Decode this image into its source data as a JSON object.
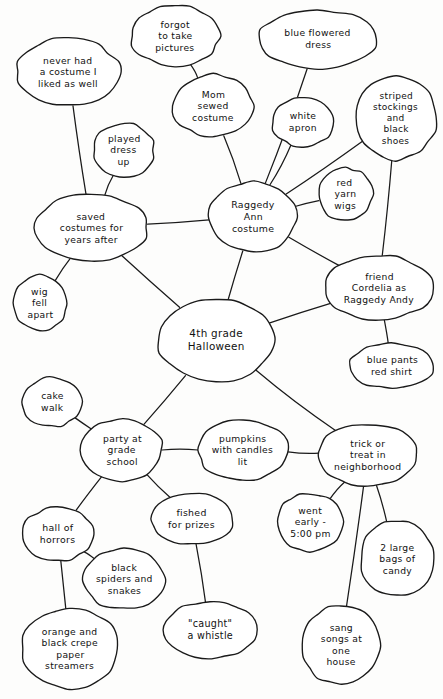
{
  "diagram": {
    "style": "hand-drawn ink on paper",
    "ink_color": "#1a1a1a",
    "paper_color": "#fdfdfc",
    "width": 443,
    "height": 699
  },
  "nodes": [
    {
      "id": "never_had",
      "label": "never had\na costume I\nliked as well",
      "cx": 68,
      "cy": 72,
      "rx": 51,
      "ry": 34,
      "font": 9.2
    },
    {
      "id": "forgot_pictures",
      "label": "forgot\nto take\npictures",
      "cx": 175,
      "cy": 36,
      "rx": 44,
      "ry": 30,
      "font": 9.2
    },
    {
      "id": "blue_dress",
      "label": "blue flowered\ndress",
      "cx": 318,
      "cy": 39,
      "rx": 59,
      "ry": 29,
      "font": 9.2
    },
    {
      "id": "mom_sewed",
      "label": "Mom\nsewed\ncostume",
      "cx": 213,
      "cy": 106,
      "rx": 40,
      "ry": 31,
      "font": 9.2
    },
    {
      "id": "white_apron",
      "label": "white\napron",
      "cx": 303,
      "cy": 122,
      "rx": 30,
      "ry": 25,
      "font": 9.2
    },
    {
      "id": "striped_stockings",
      "label": "striped\nstockings\nand\nblack\nshoes",
      "cx": 396,
      "cy": 118,
      "rx": 40,
      "ry": 41,
      "font": 9.0
    },
    {
      "id": "played_dress_up",
      "label": "played\ndress\nup",
      "cx": 124,
      "cy": 150,
      "rx": 30,
      "ry": 27,
      "font": 9.2
    },
    {
      "id": "red_yarn_wigs",
      "label": "red\nyarn\nwigs",
      "cx": 345,
      "cy": 194,
      "rx": 27,
      "ry": 26,
      "font": 9.2
    },
    {
      "id": "raggedy_ann",
      "label": "Raggedy\nAnn\ncostume",
      "cx": 253,
      "cy": 217,
      "rx": 44,
      "ry": 35,
      "font": 9.4
    },
    {
      "id": "saved_costumes",
      "label": "saved\ncostumes for\nyears after",
      "cx": 91,
      "cy": 228,
      "rx": 57,
      "ry": 33,
      "font": 9.2
    },
    {
      "id": "friend_cordelia",
      "label": "friend\nCordelia as\nRaggedy Andy",
      "cx": 379,
      "cy": 288,
      "rx": 53,
      "ry": 32,
      "font": 9.2
    },
    {
      "id": "wig_fell_apart",
      "label": "wig\nfell\napart",
      "cx": 40,
      "cy": 303,
      "rx": 27,
      "ry": 27,
      "font": 9.2
    },
    {
      "id": "halloween",
      "label": "4th grade\nHalloween",
      "cx": 216,
      "cy": 340,
      "rx": 58,
      "ry": 42,
      "font": 10.4
    },
    {
      "id": "blue_pants",
      "label": "blue pants\nred shirt",
      "cx": 392,
      "cy": 366,
      "rx": 42,
      "ry": 22,
      "font": 9.2
    },
    {
      "id": "cake_walk",
      "label": "cake\nwalk",
      "cx": 52,
      "cy": 402,
      "rx": 30,
      "ry": 24,
      "font": 9.2
    },
    {
      "id": "party_school",
      "label": "party at\ngrade\nschool",
      "cx": 122,
      "cy": 450,
      "rx": 40,
      "ry": 31,
      "font": 9.2
    },
    {
      "id": "pumpkins",
      "label": "pumpkins\nwith candles\nlit",
      "cx": 243,
      "cy": 450,
      "rx": 45,
      "ry": 30,
      "font": 9.2
    },
    {
      "id": "trick_or_treat",
      "label": "trick or\ntreat in\nneighborhood",
      "cx": 368,
      "cy": 455,
      "rx": 49,
      "ry": 31,
      "font": 9.2
    },
    {
      "id": "hall_of_horrors",
      "label": "hall of\nhorrors",
      "cx": 58,
      "cy": 534,
      "rx": 36,
      "ry": 27,
      "font": 9.4
    },
    {
      "id": "fished_prizes",
      "label": "fished\nfor prizes",
      "cx": 192,
      "cy": 519,
      "rx": 41,
      "ry": 25,
      "font": 9.4
    },
    {
      "id": "went_early",
      "label": "went\nearly -\n5:00 pm",
      "cx": 310,
      "cy": 522,
      "rx": 33,
      "ry": 29,
      "font": 9.2
    },
    {
      "id": "two_bags_candy",
      "label": "2 large\nbags of\ncandy",
      "cx": 397,
      "cy": 559,
      "rx": 37,
      "ry": 37,
      "font": 9.2
    },
    {
      "id": "black_spiders",
      "label": "black\nspiders and\nsnakes",
      "cx": 124,
      "cy": 579,
      "rx": 40,
      "ry": 30,
      "font": 9.2
    },
    {
      "id": "caught_whistle",
      "label": "\"caught\"\na whistle",
      "cx": 210,
      "cy": 630,
      "rx": 47,
      "ry": 28,
      "font": 9.6
    },
    {
      "id": "sang_songs",
      "label": "sang\nsongs at\none\nhouse",
      "cx": 341,
      "cy": 645,
      "rx": 39,
      "ry": 39,
      "font": 9.2
    },
    {
      "id": "crepe_streamers",
      "label": "orange and\nblack crepe\npaper\nstreamers",
      "cx": 70,
      "cy": 649,
      "rx": 48,
      "ry": 40,
      "font": 9.2
    }
  ],
  "edges": [
    {
      "from": "never_had",
      "to": "saved_costumes"
    },
    {
      "from": "played_dress_up",
      "to": "saved_costumes"
    },
    {
      "from": "saved_costumes",
      "to": "wig_fell_apart"
    },
    {
      "from": "saved_costumes",
      "to": "raggedy_ann"
    },
    {
      "from": "saved_costumes",
      "to": "halloween"
    },
    {
      "from": "forgot_pictures",
      "to": "mom_sewed"
    },
    {
      "from": "mom_sewed",
      "to": "raggedy_ann"
    },
    {
      "from": "blue_dress",
      "to": "raggedy_ann"
    },
    {
      "from": "white_apron",
      "to": "raggedy_ann"
    },
    {
      "from": "striped_stockings",
      "to": "raggedy_ann"
    },
    {
      "from": "red_yarn_wigs",
      "to": "raggedy_ann"
    },
    {
      "from": "striped_stockings",
      "to": "friend_cordelia"
    },
    {
      "from": "raggedy_ann",
      "to": "halloween"
    },
    {
      "from": "raggedy_ann",
      "to": "friend_cordelia"
    },
    {
      "from": "friend_cordelia",
      "to": "halloween"
    },
    {
      "from": "friend_cordelia",
      "to": "blue_pants"
    },
    {
      "from": "halloween",
      "to": "party_school"
    },
    {
      "from": "halloween",
      "to": "trick_or_treat"
    },
    {
      "from": "cake_walk",
      "to": "party_school"
    },
    {
      "from": "party_school",
      "to": "pumpkins"
    },
    {
      "from": "pumpkins",
      "to": "trick_or_treat"
    },
    {
      "from": "party_school",
      "to": "hall_of_horrors"
    },
    {
      "from": "party_school",
      "to": "fished_prizes"
    },
    {
      "from": "hall_of_horrors",
      "to": "black_spiders"
    },
    {
      "from": "hall_of_horrors",
      "to": "crepe_streamers"
    },
    {
      "from": "fished_prizes",
      "to": "caught_whistle"
    },
    {
      "from": "trick_or_treat",
      "to": "went_early"
    },
    {
      "from": "trick_or_treat",
      "to": "sang_songs"
    },
    {
      "from": "trick_or_treat",
      "to": "two_bags_candy"
    }
  ]
}
